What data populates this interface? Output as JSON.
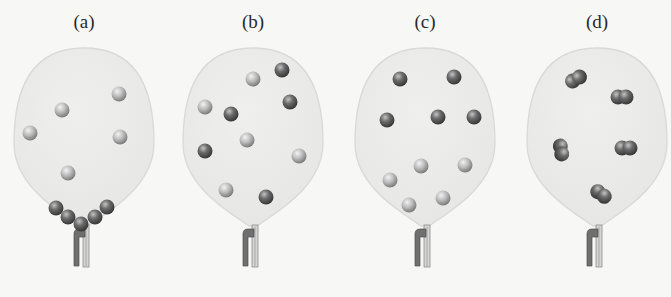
{
  "figure": {
    "colors": {
      "background": "#f7f7f6",
      "balloon_fill": "#ebebea",
      "balloon_stroke": "#d9d9d8",
      "light_sphere": "#b9b9b9",
      "dark_sphere": "#6a6a6a",
      "clamp": "#6f6f6f",
      "tube": "#c9c9c9"
    },
    "panels": [
      {
        "label": "(a)",
        "cx": 84,
        "description": "atoms; several light atoms free, five dark atoms collected at bottom of balloon",
        "light_atoms": [
          [
            62,
            110
          ],
          [
            119,
            94
          ],
          [
            30,
            133
          ],
          [
            120,
            137
          ],
          [
            68,
            173
          ]
        ],
        "dark_atoms": [
          [
            56,
            208
          ],
          [
            68,
            217
          ],
          [
            81,
            224
          ],
          [
            95,
            217
          ],
          [
            107,
            207
          ]
        ],
        "molecules": []
      },
      {
        "label": "(b)",
        "cx": 253,
        "description": "mixture of light and dark atoms evenly distributed",
        "light_atoms": [
          [
            253,
            79
          ],
          [
            205,
            107
          ],
          [
            247,
            140
          ],
          [
            299,
            156
          ],
          [
            226,
            190
          ]
        ],
        "dark_atoms": [
          [
            282,
            70
          ],
          [
            231,
            114
          ],
          [
            290,
            102
          ],
          [
            205,
            151
          ],
          [
            266,
            197
          ]
        ],
        "molecules": []
      },
      {
        "label": "(c)",
        "cx": 425,
        "description": "dark atoms in upper half, light atoms in lower half",
        "light_atoms": [
          [
            421,
            166
          ],
          [
            465,
            165
          ],
          [
            390,
            180
          ],
          [
            409,
            205
          ],
          [
            443,
            198
          ]
        ],
        "dark_atoms": [
          [
            400,
            79
          ],
          [
            454,
            77
          ],
          [
            387,
            120
          ],
          [
            438,
            117
          ],
          [
            474,
            117
          ]
        ],
        "molecules": []
      },
      {
        "label": "(d)",
        "cx": 597,
        "description": "five diatomic molecules distributed in balloon",
        "light_atoms": [],
        "dark_atoms": [],
        "molecules": [
          [
            576,
            79,
            -30
          ],
          [
            622,
            97,
            0
          ],
          [
            561,
            150,
            80
          ],
          [
            626,
            148,
            0
          ],
          [
            601,
            194,
            35
          ]
        ]
      }
    ]
  }
}
